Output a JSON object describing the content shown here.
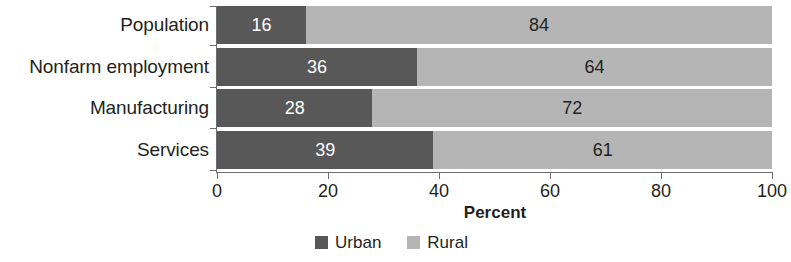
{
  "chart_data": {
    "type": "bar",
    "orientation": "horizontal",
    "stacked": true,
    "title": "",
    "xlabel": "Percent",
    "ylabel": "",
    "xlim": [
      0,
      100
    ],
    "grid": false,
    "legend_position": "bottom-center",
    "categories": [
      "Population",
      "Nonfarm employment",
      "Manufacturing",
      "Services"
    ],
    "xticks": [
      "0",
      "20",
      "40",
      "60",
      "80",
      "100"
    ],
    "xtick_values": [
      0,
      20,
      40,
      60,
      80,
      100
    ],
    "series": [
      {
        "name": "Urban",
        "color": "#585858",
        "values": [
          16,
          36,
          28,
          39
        ],
        "labels": [
          "16",
          "36",
          "28",
          "39"
        ]
      },
      {
        "name": "Rural",
        "color": "#b5b5b5",
        "values": [
          84,
          64,
          72,
          61
        ],
        "labels": [
          "84",
          "64",
          "72",
          "61"
        ]
      }
    ]
  },
  "legend": {
    "items": [
      {
        "label": "Urban",
        "color": "#585858",
        "swatch_name": "legend-swatch-urban"
      },
      {
        "label": "Rural",
        "color": "#b5b5b5",
        "swatch_name": "legend-swatch-rural"
      }
    ]
  }
}
